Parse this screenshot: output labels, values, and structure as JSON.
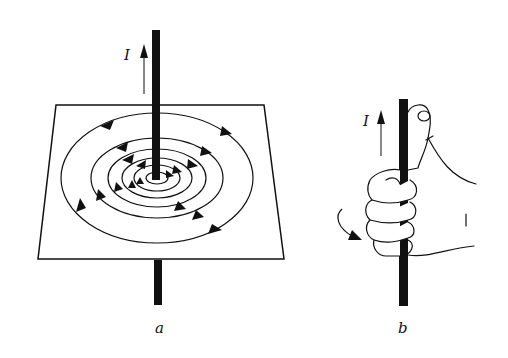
{
  "figure": {
    "panel_a": {
      "label": "a",
      "current_label": "I",
      "description": "Straight current-carrying wire passing vertically through a horizontal plane; concentric circular magnetic field lines with direction arrows (counter-clockwise viewed from above)"
    },
    "panel_b": {
      "label": "b",
      "current_label": "I",
      "description": "Right-hand grip rule: right hand grasping wire with thumb pointing in direction of current, curled fingers showing field direction"
    }
  },
  "colors": {
    "ink": "#111111",
    "background": "#ffffff"
  }
}
